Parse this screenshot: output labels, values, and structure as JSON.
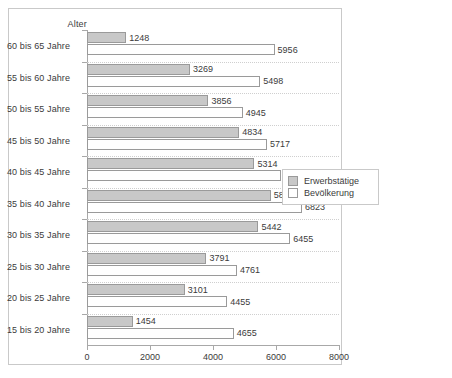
{
  "chart_data": {
    "type": "bar",
    "title": "",
    "orientation": "horizontal",
    "grouped": true,
    "ylabel": "Alter",
    "xlabel": "",
    "xlim": [
      0,
      8000
    ],
    "xticks": [
      0,
      2000,
      4000,
      6000,
      8000
    ],
    "xtick_labels": [
      "0",
      "2000",
      "4000",
      "6000",
      "8000"
    ],
    "grid": true,
    "legend_position": "right",
    "categories": [
      "60 bis 65 Jahre",
      "55 bis 60 Jahre",
      "50 bis 55 Jahre",
      "45 bis 50 Jahre",
      "40 bis 45 Jahre",
      "35 bis 40 Jahre",
      "30 bis 35 Jahre",
      "25 bis 30 Jahre",
      "20 bis 25 Jahre",
      "15 bis 20 Jahre"
    ],
    "series": [
      {
        "name": "Erwerbstätige",
        "color": "#c8c8c8",
        "values": [
          1248,
          3269,
          3856,
          4834,
          5314,
          5831,
          5442,
          3791,
          3101,
          1454
        ],
        "labels": [
          "1248",
          "3269",
          "3856",
          "4834",
          "5314",
          "5831",
          "5442",
          "3791",
          "3101",
          "1454"
        ]
      },
      {
        "name": "Bevölkerung",
        "color": "#ffffff",
        "values": [
          5956,
          5498,
          4945,
          5717,
          6168,
          6823,
          6455,
          4761,
          4455,
          4655
        ],
        "labels": [
          "5956",
          "5498",
          "4945",
          "5717",
          "6168",
          "6823",
          "6455",
          "4761",
          "4455",
          "4655"
        ]
      }
    ]
  },
  "legend": {
    "items": [
      {
        "label": "Erwerbstätige",
        "color": "#c8c8c8"
      },
      {
        "label": "Bevölkerung",
        "color": "#ffffff"
      }
    ]
  },
  "axis": {
    "y_title": "Alter"
  }
}
